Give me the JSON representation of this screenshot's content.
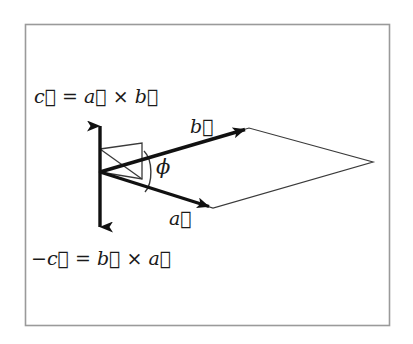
{
  "figure": {
    "name": "vector-cross-product-diagram",
    "border_color": "#9a9a9a",
    "ink_color": "#111111",
    "thin_ink_color": "#3a3a3a",
    "background": "#ffffff"
  },
  "labels": {
    "c_positive": "c⃗ = a⃗ × b⃗",
    "c_negative": "−c⃗ = b⃗ × a⃗",
    "vector_b": "b⃗",
    "vector_a": "a⃗",
    "angle_phi": "ϕ"
  },
  "geometry": {
    "origin": {
      "x": 100,
      "y": 172
    },
    "vector_a_tip": {
      "x": 213,
      "y": 208
    },
    "vector_b_tip": {
      "x": 249,
      "y": 128
    },
    "vector_c_up_tip": {
      "x": 100,
      "y": 120
    },
    "vector_c_down_tip": {
      "x": 100,
      "y": 233
    },
    "parallelogram_far_vertex": {
      "x": 373,
      "y": 162
    },
    "border": {
      "x": 25,
      "y": 24,
      "width": 365,
      "height": 302
    }
  }
}
